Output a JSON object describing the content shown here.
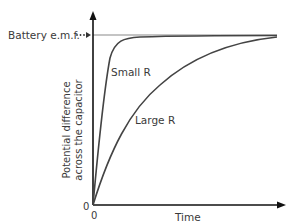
{
  "diagram": {
    "type": "capacitor-charging-graph",
    "y_axis_label_line1": "Potential difference",
    "y_axis_label_line2": "across the capacitor",
    "x_axis_label": "Time",
    "origin_y_label": "0",
    "origin_x_label": "0",
    "asymptote_label": "Battery e.m.f.",
    "curves": [
      {
        "name": "Small R",
        "label": "Small R",
        "description": "rapid exponential rise to battery e.m.f."
      },
      {
        "name": "Large R",
        "label": "Large R",
        "description": "slow exponential rise to battery e.m.f."
      }
    ],
    "colors": {
      "axis": "#111111",
      "curve": "#444444",
      "asymptote": "#888888",
      "text": "#3a3a3a"
    }
  }
}
